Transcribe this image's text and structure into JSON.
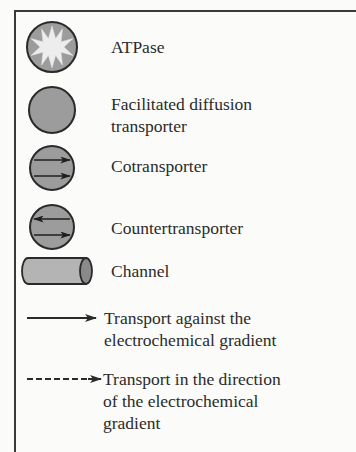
{
  "legend": {
    "items": [
      {
        "icon": "atpase-starburst-circle-icon",
        "label": "ATPase"
      },
      {
        "icon": "gray-circle-icon",
        "label_lines": [
          "Facilitated diffusion",
          "transporter"
        ]
      },
      {
        "icon": "circle-two-right-arrows-icon",
        "label": "Cotransporter"
      },
      {
        "icon": "circle-opposing-arrows-icon",
        "label": "Countertransporter"
      },
      {
        "icon": "cylinder-icon",
        "label": "Channel"
      },
      {
        "icon": "solid-arrow-icon",
        "label_lines": [
          "Transport against the",
          "electrochemical gradient"
        ]
      },
      {
        "icon": "dashed-arrow-icon",
        "label_lines": [
          "Transport in the direction",
          "of the electrochemical",
          "gradient"
        ]
      }
    ]
  },
  "colors": {
    "fill_gray": "#9c9c9c",
    "star_fill": "#ededed",
    "outline": "#2a2a2a",
    "background": "#fbfbfa"
  }
}
